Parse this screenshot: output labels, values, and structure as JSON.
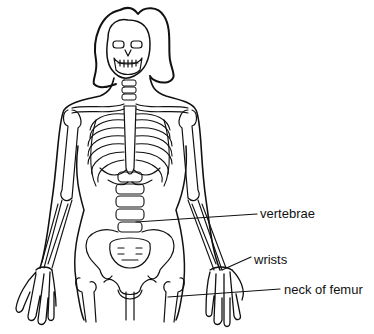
{
  "diagram": {
    "colors": {
      "line": "#111111",
      "background": "#ffffff"
    },
    "labels": [
      {
        "id": "vertebrae",
        "text": "vertebrae",
        "x": 260,
        "y": 207,
        "line": [
          136,
          222,
          257,
          214
        ]
      },
      {
        "id": "wrists",
        "text": "wrists",
        "x": 254,
        "y": 253,
        "line": [
          222,
          270,
          251,
          257
        ]
      },
      {
        "id": "neck-of-femur",
        "text": "neck of femur",
        "x": 284,
        "y": 283,
        "line": [
          168,
          297,
          280,
          289
        ]
      }
    ]
  }
}
